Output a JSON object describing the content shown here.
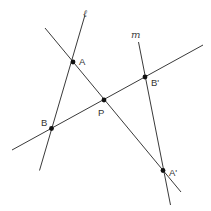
{
  "diagram": {
    "lines": [
      {
        "id": "l",
        "label": "ℓ"
      },
      {
        "id": "m",
        "label": "m"
      },
      {
        "id": "AA'",
        "label": ""
      },
      {
        "id": "BB'",
        "label": ""
      }
    ],
    "points": [
      {
        "id": "A",
        "label": "A"
      },
      {
        "id": "B",
        "label": "B"
      },
      {
        "id": "P",
        "label": "P"
      },
      {
        "id": "B'",
        "label": "B'"
      },
      {
        "id": "A'",
        "label": "A'"
      }
    ]
  }
}
